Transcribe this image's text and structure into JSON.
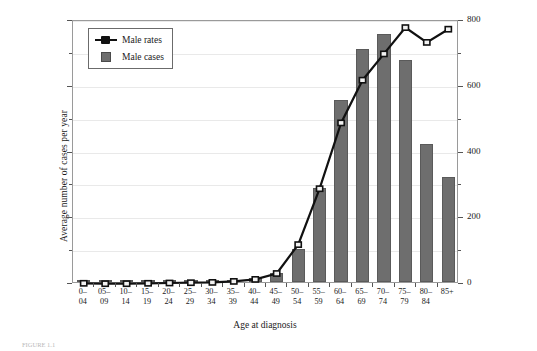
{
  "chart_data": {
    "type": "bar",
    "title": "",
    "xlabel": "Age at diagnosis",
    "ylabel": "Average number of cases per year",
    "y2label": "Rate per 100,000",
    "ylim": [
      0,
      8000
    ],
    "y2lim": [
      0,
      800
    ],
    "yticks": [
      0,
      2000,
      4000,
      6000,
      8000
    ],
    "y2ticks": [
      0,
      200,
      400,
      600,
      800
    ],
    "yminor": [
      1000,
      3000,
      5000,
      7000
    ],
    "y2minor": [
      100,
      300,
      500,
      700
    ],
    "grid": true,
    "legend_position": "top-left",
    "categories": [
      "0–\n04",
      "05–\n09",
      "10–\n14",
      "15–\n19",
      "20–\n24",
      "25–\n29",
      "30–\n34",
      "35–\n39",
      "40–\n44",
      "45–\n49",
      "50–\n54",
      "55–\n59",
      "60–\n64",
      "65–\n69",
      "70–\n74",
      "75–\n79",
      "80–\n84",
      "85+"
    ],
    "series": [
      {
        "name": "Male cases",
        "type": "bar",
        "axis": "left",
        "color": "#6e6e6e",
        "values": [
          15,
          10,
          12,
          18,
          25,
          30,
          40,
          60,
          110,
          260,
          1000,
          2850,
          5550,
          7100,
          7550,
          6750,
          4200,
          3200
        ]
      },
      {
        "name": "Male rates",
        "type": "line",
        "axis": "right",
        "color": "#111111",
        "values": [
          2,
          1,
          1,
          2,
          3,
          4,
          5,
          8,
          14,
          32,
          120,
          290,
          490,
          620,
          700,
          780,
          735,
          775
        ]
      }
    ]
  },
  "legend": {
    "items": [
      {
        "label": "Male rates",
        "marker": "line-marker"
      },
      {
        "label": "Male cases",
        "marker": "bar-swatch"
      }
    ]
  },
  "caption": {
    "text": "FIGURE 1.1"
  }
}
